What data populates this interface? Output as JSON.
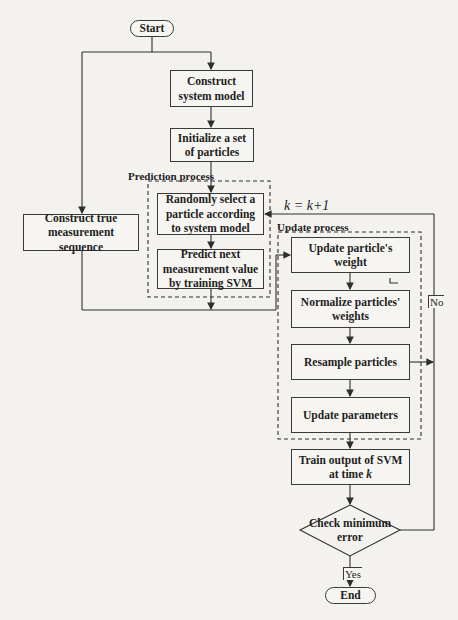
{
  "diagram": {
    "type": "flowchart",
    "nodes": {
      "start": "Start",
      "construct_system_model": "Construct system model",
      "initialize_particles": "Initialize a set of particles",
      "construct_true_measurement": "Construct true measurement sequence",
      "randomly_select": "Randomly select a particle according to system model",
      "predict_next": "Predict next measurement value by training SVM",
      "update_weight": "Update particle's weight",
      "normalize_weights": "Normalize particles' weights",
      "resample": "Resample particles",
      "update_parameters": "Update parameters",
      "train_output": "Train output of SVM at time",
      "train_output_var": "k",
      "check_error": "Check minimum error",
      "end": "End"
    },
    "groups": {
      "prediction": "Prediction process",
      "update": "Update process"
    },
    "edge_labels": {
      "loop": "k = k+1",
      "no": "No",
      "yes": "Yes"
    },
    "colors": {
      "line": "#2e2e2e",
      "background": "#f3f2ee",
      "box_fill": "#f6f5f1"
    }
  }
}
